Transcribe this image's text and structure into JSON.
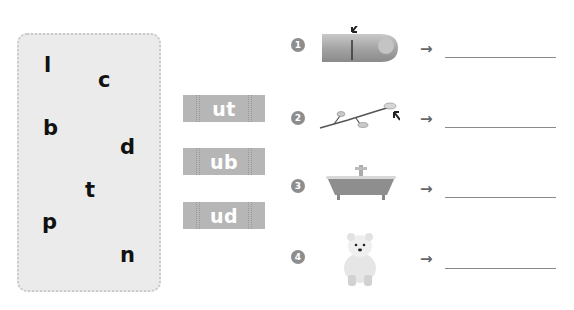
{
  "letters_panel": {
    "letters": [
      {
        "char": "l",
        "x": 44,
        "y": 55
      },
      {
        "char": "c",
        "x": 98,
        "y": 70
      },
      {
        "char": "b",
        "x": 43,
        "y": 118
      },
      {
        "char": "d",
        "x": 120,
        "y": 137
      },
      {
        "char": "t",
        "x": 85,
        "y": 180
      },
      {
        "char": "p",
        "x": 42,
        "y": 212
      },
      {
        "char": "n",
        "x": 120,
        "y": 245
      }
    ]
  },
  "endings": [
    {
      "label": "ut",
      "top": 95
    },
    {
      "label": "ub",
      "top": 148
    },
    {
      "label": "ud",
      "top": 202
    }
  ],
  "items": [
    {
      "number": "1",
      "picture": "finger-with-cut",
      "arrow": "→",
      "answer": ""
    },
    {
      "number": "2",
      "picture": "branch-with-bud",
      "arrow": "→",
      "answer": ""
    },
    {
      "number": "3",
      "picture": "bathtub",
      "arrow": "→",
      "answer": ""
    },
    {
      "number": "4",
      "picture": "polar-bear-cub",
      "arrow": "→",
      "answer": ""
    }
  ],
  "colors": {
    "panel_bg": "#ebebeb",
    "chip_bg": "#b6b6b6",
    "badge_bg": "#8d8d8d",
    "line": "#8a8a8a"
  }
}
